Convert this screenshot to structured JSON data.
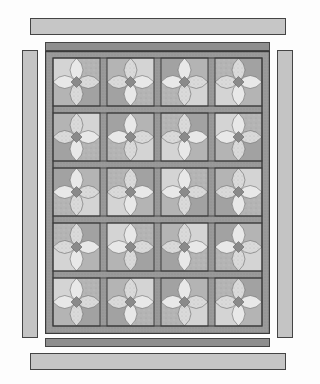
{
  "diagram": {
    "title": "",
    "grid": {
      "columns": 4,
      "rows": 5
    },
    "colors": {
      "background": "#fdfdfd",
      "outline": "#3a3a3a",
      "outer_border": "#c4c4c4",
      "inner_strip": "#8e8e8e",
      "sashing": "#9a9a9a",
      "block_light": "#d4d4d4",
      "block_mid": "#b4b4b4",
      "block_dark": "#a2a2a2",
      "petal_light": "#e8e8e8",
      "petal_speckle": "#dadada",
      "center_diamond": "#8a8a8a"
    },
    "pieces": {
      "outer_top": {
        "x": 30,
        "y": 18,
        "w": 256,
        "h": 17
      },
      "inner_top": {
        "x": 45,
        "y": 42,
        "w": 225,
        "h": 9
      },
      "outer_left": {
        "x": 22,
        "y": 50,
        "w": 16,
        "h": 288
      },
      "outer_right": {
        "x": 277,
        "y": 50,
        "w": 16,
        "h": 288
      },
      "inner_bottom": {
        "x": 45,
        "y": 338,
        "w": 225,
        "h": 9
      },
      "outer_bottom": {
        "x": 30,
        "y": 353,
        "w": 256,
        "h": 17
      },
      "quilt_body": {
        "x": 45,
        "y": 51,
        "w": 225,
        "h": 283
      }
    }
  }
}
